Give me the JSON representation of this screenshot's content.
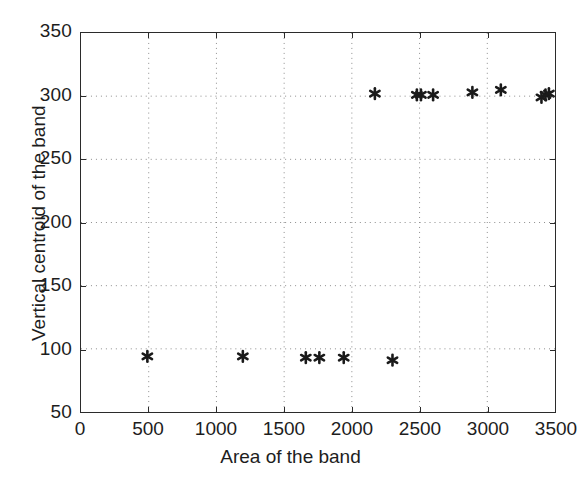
{
  "chart_data": {
    "type": "scatter",
    "title": "",
    "xlabel": "Area of the band",
    "ylabel": "Vertical centroid of the band",
    "xlim": [
      0,
      3500
    ],
    "ylim": [
      50,
      350
    ],
    "xticks": [
      0,
      500,
      1000,
      1500,
      2000,
      2500,
      3000,
      3500
    ],
    "yticks": [
      50,
      100,
      150,
      200,
      250,
      300,
      350
    ],
    "grid": true,
    "grid_style": "dotted",
    "marker": "asterisk",
    "marker_color": "#1a1a1a",
    "series": [
      {
        "name": "bands",
        "x": [
          490,
          1195,
          1660,
          1760,
          1940,
          2300,
          2170,
          2480,
          2510,
          2600,
          2890,
          3100,
          3400,
          3430,
          3455
        ],
        "y": [
          94,
          94,
          93,
          93,
          93,
          91,
          302,
          301,
          301,
          301,
          303,
          305,
          299,
          301,
          302
        ]
      }
    ],
    "clusters": [
      {
        "name": "lower-cluster",
        "approx_y": 93,
        "points": [
          {
            "x": 490,
            "y": 94
          },
          {
            "x": 1195,
            "y": 94
          },
          {
            "x": 1660,
            "y": 93
          },
          {
            "x": 1760,
            "y": 93
          },
          {
            "x": 1940,
            "y": 93
          },
          {
            "x": 2300,
            "y": 91
          }
        ]
      },
      {
        "name": "upper-cluster",
        "approx_y": 301,
        "points": [
          {
            "x": 2170,
            "y": 302
          },
          {
            "x": 2480,
            "y": 301
          },
          {
            "x": 2510,
            "y": 301
          },
          {
            "x": 2600,
            "y": 301
          },
          {
            "x": 2890,
            "y": 303
          },
          {
            "x": 3100,
            "y": 305
          },
          {
            "x": 3400,
            "y": 299
          },
          {
            "x": 3430,
            "y": 301
          },
          {
            "x": 3455,
            "y": 302
          }
        ]
      }
    ]
  },
  "axes": {
    "x_tick_labels": [
      "0",
      "500",
      "1000",
      "1500",
      "2000",
      "2500",
      "3000",
      "3500"
    ],
    "y_tick_labels": [
      "50",
      "100",
      "150",
      "200",
      "250",
      "300",
      "350"
    ],
    "x_title": "Area of the band",
    "y_title": "Vertical centroid of the band"
  }
}
